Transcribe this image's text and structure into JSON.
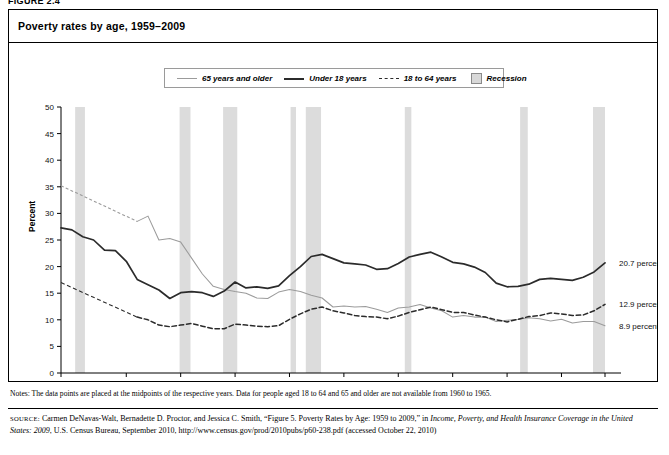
{
  "figure": {
    "label": "FIGURE 2.4"
  },
  "panel": {
    "title": "Poverty rates by age, 1959–2009"
  },
  "legend": {
    "items": [
      {
        "label": "65 years and older",
        "style": "solid-light",
        "color": "#9b9b9b"
      },
      {
        "label": "Under 18 years",
        "style": "solid-dark",
        "color": "#2b2b2b"
      },
      {
        "label": "18 to 64 years",
        "style": "dashed",
        "color": "#2b2b2b"
      },
      {
        "label": "Recession",
        "style": "box",
        "color": "#d8d8d8"
      }
    ]
  },
  "axes": {
    "ylabel": "Percent",
    "yticks": [
      "0",
      "5",
      "10",
      "15",
      "20",
      "25",
      "30",
      "35",
      "40",
      "45",
      "50"
    ],
    "xticks": [
      "1959",
      "1965",
      "1970",
      "1975",
      "1980",
      "1985",
      "1990",
      "1995",
      "2000",
      "2005",
      "2009"
    ]
  },
  "end_labels": [
    {
      "text": "20.7 percent",
      "series": "Under 18 years",
      "value": 20.7
    },
    {
      "text": "12.9 percent",
      "series": "18 to 64 years",
      "value": 12.9
    },
    {
      "text": "8.9 percent",
      "series": "65 years and older",
      "value": 8.9
    }
  ],
  "notes": {
    "text": "Notes: The data points are placed at the midpoints of the respective years. Data for people aged 18 to 64 and 65 and older are not available from 1960 to 1965."
  },
  "source": {
    "prefix": "SOURCE:",
    "line1": " Carmen DeNavas-Walt, Bernadette D. Proctor, and Jessica C. Smith, “Figure 5. Poverty Rates by Age: 1959 to 2009,” in ",
    "italic1": "Income, Poverty, and Health Insurance Coverage in the United States: 2009",
    "line2": ", U.S. Census Bureau, September 2010, http://www.census.gov/prod/2010pubs/p60-238.pdf (accessed October 22, 2010)"
  },
  "chart_data": {
    "type": "line",
    "title": "Poverty rates by age, 1959–2009",
    "xlabel": "",
    "ylabel": "Percent",
    "xlim": [
      1959,
      2009
    ],
    "ylim": [
      0,
      50
    ],
    "grid": false,
    "legend_position": "top-center",
    "x": [
      1959,
      1960,
      1961,
      1962,
      1963,
      1964,
      1965,
      1966,
      1967,
      1968,
      1969,
      1970,
      1971,
      1972,
      1973,
      1974,
      1975,
      1976,
      1977,
      1978,
      1979,
      1980,
      1981,
      1982,
      1983,
      1984,
      1985,
      1986,
      1987,
      1988,
      1989,
      1990,
      1991,
      1992,
      1993,
      1994,
      1995,
      1996,
      1997,
      1998,
      1999,
      2000,
      2001,
      2002,
      2003,
      2004,
      2005,
      2006,
      2007,
      2008,
      2009
    ],
    "series": [
      {
        "name": "65 years and older",
        "style": "solid-light",
        "color": "#9b9b9b",
        "end_value": 8.9,
        "values": [
          35.2,
          null,
          null,
          null,
          null,
          null,
          null,
          28.5,
          29.5,
          25.0,
          25.3,
          24.6,
          21.6,
          18.6,
          16.3,
          15.7,
          15.3,
          15.0,
          14.1,
          14.0,
          15.2,
          15.7,
          15.3,
          14.6,
          14.1,
          12.4,
          12.6,
          12.4,
          12.5,
          12.0,
          11.4,
          12.2,
          12.4,
          12.9,
          12.2,
          11.7,
          10.5,
          10.8,
          10.5,
          10.5,
          9.7,
          9.9,
          10.1,
          10.4,
          10.2,
          9.8,
          10.1,
          9.4,
          9.7,
          9.7,
          8.9
        ]
      },
      {
        "name": "Under 18 years",
        "style": "solid-dark",
        "color": "#2b2b2b",
        "end_value": 20.7,
        "values": [
          27.3,
          26.9,
          25.6,
          25.0,
          23.1,
          23.0,
          21.0,
          17.6,
          16.6,
          15.6,
          14.0,
          15.1,
          15.3,
          15.1,
          14.4,
          15.4,
          17.1,
          16.0,
          16.2,
          15.9,
          16.4,
          18.3,
          20.0,
          21.9,
          22.3,
          21.5,
          20.7,
          20.5,
          20.3,
          19.5,
          19.6,
          20.6,
          21.8,
          22.3,
          22.7,
          21.8,
          20.8,
          20.5,
          19.9,
          18.9,
          16.9,
          16.2,
          16.3,
          16.7,
          17.6,
          17.8,
          17.6,
          17.4,
          18.0,
          19.0,
          20.7
        ]
      },
      {
        "name": "18 to 64 years",
        "style": "dashed",
        "color": "#2b2b2b",
        "end_value": 12.9,
        "values": [
          17.0,
          null,
          null,
          null,
          null,
          null,
          null,
          10.5,
          10.0,
          9.0,
          8.7,
          9.0,
          9.3,
          8.8,
          8.3,
          8.3,
          9.2,
          9.0,
          8.8,
          8.7,
          8.9,
          10.1,
          11.1,
          12.0,
          12.4,
          11.7,
          11.3,
          10.8,
          10.6,
          10.5,
          10.2,
          10.7,
          11.4,
          11.9,
          12.4,
          11.9,
          11.4,
          11.4,
          10.9,
          10.5,
          10.0,
          9.6,
          10.1,
          10.6,
          10.8,
          11.3,
          11.1,
          10.8,
          10.9,
          11.7,
          12.9
        ]
      }
    ],
    "recessions": [
      {
        "start": 1960.3,
        "end": 1961.2
      },
      {
        "start": 1969.9,
        "end": 1970.9
      },
      {
        "start": 1973.9,
        "end": 1975.2
      },
      {
        "start": 1980.1,
        "end": 1980.6
      },
      {
        "start": 1981.5,
        "end": 1982.9
      },
      {
        "start": 1990.6,
        "end": 1991.2
      },
      {
        "start": 2001.2,
        "end": 2001.9
      },
      {
        "start": 2007.9,
        "end": 2009.5
      }
    ]
  }
}
